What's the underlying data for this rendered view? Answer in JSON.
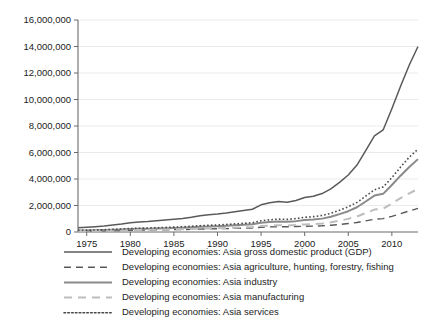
{
  "chart_data": {
    "type": "line",
    "title": "",
    "xlabel": "",
    "ylabel": "",
    "xlim": [
      1974,
      2013
    ],
    "ylim": [
      0,
      16000000
    ],
    "grid": true,
    "legend_position": "bottom",
    "y_ticks": [
      0,
      2000000,
      4000000,
      6000000,
      8000000,
      10000000,
      12000000,
      14000000,
      16000000
    ],
    "y_tick_labels": [
      "0",
      "2,000,000",
      "4,000,000",
      "6,000,000",
      "8,000,000",
      "10,000,000",
      "12,000,000",
      "14,000,000",
      "16,000,000"
    ],
    "x_ticks": [
      1975,
      1980,
      1985,
      1990,
      1995,
      2000,
      2005,
      2010
    ],
    "x_tick_labels": [
      "1975",
      "1980",
      "1985",
      "1990",
      "1995",
      "2000",
      "2005",
      "2010"
    ],
    "x": [
      1974,
      1975,
      1976,
      1977,
      1978,
      1979,
      1980,
      1981,
      1982,
      1983,
      1984,
      1985,
      1986,
      1987,
      1988,
      1989,
      1990,
      1991,
      1992,
      1993,
      1994,
      1995,
      1996,
      1997,
      1998,
      1999,
      2000,
      2001,
      2002,
      2003,
      2004,
      2005,
      2006,
      2007,
      2008,
      2009,
      2010,
      2011,
      2012,
      2013
    ],
    "series": [
      {
        "name": "Developing economies: Asia gross domestic product (GDP)",
        "style": "solid",
        "color": "#5a5a5a",
        "width": 1.5,
        "values": [
          330000,
          360000,
          400000,
          450000,
          520000,
          600000,
          700000,
          760000,
          790000,
          840000,
          900000,
          960000,
          1020000,
          1110000,
          1230000,
          1300000,
          1350000,
          1430000,
          1530000,
          1620000,
          1720000,
          2050000,
          2200000,
          2300000,
          2250000,
          2380000,
          2600000,
          2700000,
          2900000,
          3250000,
          3750000,
          4300000,
          5050000,
          6150000,
          7250000,
          7700000,
          9300000,
          11000000,
          12600000,
          14000000
        ]
      },
      {
        "name": "Developing economies: Asia agriculture, hunting, forestry, fishing",
        "style": "dashed",
        "color": "#585858",
        "width": 1.4,
        "values": [
          75000,
          82000,
          88000,
          95000,
          105000,
          118000,
          132000,
          140000,
          148000,
          158000,
          168000,
          178000,
          188000,
          200000,
          218000,
          232000,
          245000,
          258000,
          272000,
          288000,
          305000,
          360000,
          385000,
          400000,
          395000,
          410000,
          430000,
          445000,
          470000,
          510000,
          570000,
          640000,
          720000,
          840000,
          960000,
          1010000,
          1180000,
          1380000,
          1590000,
          1780000
        ]
      },
      {
        "name": "Developing economies: Asia industry",
        "style": "solid",
        "color": "#8a8a8a",
        "width": 2.0,
        "values": [
          105000,
          115000,
          128000,
          142000,
          162000,
          188000,
          218000,
          236000,
          248000,
          265000,
          285000,
          305000,
          325000,
          355000,
          395000,
          420000,
          440000,
          468000,
          505000,
          540000,
          578000,
          700000,
          755000,
          795000,
          775000,
          820000,
          900000,
          935000,
          1010000,
          1150000,
          1350000,
          1570000,
          1870000,
          2300000,
          2750000,
          2880000,
          3550000,
          4250000,
          4900000,
          5500000
        ]
      },
      {
        "name": "Developing economies: Asia manufacturing",
        "style": "light-dashed",
        "color": "#bdbdbd",
        "width": 2.0,
        "values": [
          68000,
          74000,
          82000,
          92000,
          105000,
          122000,
          141000,
          153000,
          161000,
          172000,
          185000,
          198000,
          211000,
          230000,
          256000,
          272000,
          285000,
          303000,
          327000,
          350000,
          374000,
          450000,
          485000,
          510000,
          497000,
          525000,
          575000,
          597000,
          645000,
          730000,
          855000,
          990000,
          1170000,
          1430000,
          1690000,
          1760000,
          2150000,
          2550000,
          2920000,
          3250000
        ]
      },
      {
        "name": "Developing economies: Asia services",
        "style": "dotted",
        "color": "#4a4a4a",
        "width": 1.6,
        "values": [
          125000,
          138000,
          152000,
          170000,
          196000,
          226000,
          262000,
          285000,
          300000,
          320000,
          344000,
          368000,
          393000,
          428000,
          476000,
          506000,
          530000,
          565000,
          610000,
          652000,
          698000,
          850000,
          920000,
          970000,
          950000,
          1010000,
          1110000,
          1160000,
          1250000,
          1410000,
          1640000,
          1900000,
          2230000,
          2700000,
          3180000,
          3400000,
          4100000,
          4900000,
          5650000,
          6250000
        ]
      }
    ]
  },
  "legend": {
    "items": [
      {
        "label": "Developing economies: Asia gross domestic product (GDP)",
        "swatch": "solid-dark-line-icon"
      },
      {
        "label": "Developing economies: Asia agriculture, hunting, forestry, fishing",
        "swatch": "dashed-dark-line-icon"
      },
      {
        "label": "Developing economies: Asia industry",
        "swatch": "solid-gray-line-icon"
      },
      {
        "label": "Developing economies: Asia manufacturing",
        "swatch": "dashed-light-line-icon"
      },
      {
        "label": "Developing economies: Asia services",
        "swatch": "dotted-line-icon"
      }
    ]
  },
  "colors": {
    "gdp": "#5a5a5a",
    "agriculture": "#585858",
    "industry": "#8a8a8a",
    "manufacturing": "#bdbdbd",
    "services": "#4a4a4a",
    "grid": "#e6e6e6",
    "axis": "#6b6b6b",
    "text": "#1c1c1c",
    "background": "#ffffff"
  }
}
